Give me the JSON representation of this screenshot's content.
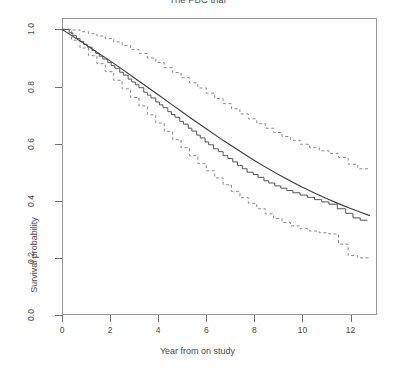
{
  "chart_data": {
    "type": "line",
    "title": "The PBC trial",
    "xlabel": "Year from on study",
    "ylabel": "Survival probability",
    "xlim": [
      0,
      13.1
    ],
    "ylim": [
      0.0,
      1.04
    ],
    "xticks": [
      0,
      2,
      4,
      6,
      8,
      10,
      12
    ],
    "xticklabels": [
      "0",
      "2",
      "4",
      "6",
      "8",
      "10",
      "12"
    ],
    "yticks": [
      0.0,
      0.2,
      0.4,
      0.6,
      0.8,
      1.0
    ],
    "yticklabels": [
      "0.0",
      "0.2",
      "0.4",
      "0.6",
      "0.8",
      "1.0"
    ],
    "grid": false,
    "legend": "none",
    "box": true,
    "colors": {
      "km_step": "#4a4a4a",
      "smooth_fit": "#3a3a3a",
      "confidence_band": "#8a8a8a",
      "axis": "#9a9a9a",
      "text": "#4a4a4a"
    },
    "series": [
      {
        "name": "Kaplan-Meier estimate",
        "style": "step",
        "linestyle": "solid",
        "x": [
          0.0,
          0.3,
          0.45,
          0.6,
          0.75,
          0.9,
          1.05,
          1.25,
          1.4,
          1.55,
          1.7,
          1.9,
          2.05,
          2.2,
          2.4,
          2.55,
          2.75,
          2.9,
          3.05,
          3.2,
          3.4,
          3.55,
          3.7,
          3.9,
          4.05,
          4.2,
          4.4,
          4.55,
          4.7,
          4.9,
          5.05,
          5.25,
          5.4,
          5.6,
          5.75,
          5.95,
          6.1,
          6.3,
          6.5,
          6.7,
          6.9,
          7.1,
          7.3,
          7.5,
          7.7,
          7.95,
          8.15,
          8.4,
          8.6,
          8.85,
          9.1,
          9.35,
          9.6,
          9.9,
          10.2,
          10.5,
          10.8,
          11.1,
          11.45,
          11.8,
          12.1,
          12.4,
          12.7
        ],
        "y": [
          1.0,
          0.988,
          0.978,
          0.968,
          0.958,
          0.948,
          0.938,
          0.926,
          0.916,
          0.906,
          0.896,
          0.884,
          0.874,
          0.864,
          0.85,
          0.84,
          0.826,
          0.816,
          0.806,
          0.796,
          0.78,
          0.77,
          0.76,
          0.746,
          0.736,
          0.726,
          0.712,
          0.702,
          0.692,
          0.678,
          0.668,
          0.654,
          0.644,
          0.63,
          0.62,
          0.606,
          0.596,
          0.582,
          0.572,
          0.558,
          0.548,
          0.536,
          0.524,
          0.512,
          0.5,
          0.492,
          0.482,
          0.47,
          0.462,
          0.452,
          0.444,
          0.436,
          0.428,
          0.42,
          0.412,
          0.404,
          0.396,
          0.388,
          0.372,
          0.356,
          0.34,
          0.332,
          0.332
        ]
      },
      {
        "name": "Fitted / model survival",
        "style": "smooth",
        "linestyle": "solid",
        "x": [
          0.0,
          0.5,
          1.0,
          1.5,
          2.0,
          2.5,
          3.0,
          3.5,
          4.0,
          4.5,
          5.0,
          5.5,
          6.0,
          6.5,
          7.0,
          7.5,
          8.0,
          8.5,
          9.0,
          9.5,
          10.0,
          10.5,
          11.0,
          11.5,
          12.0,
          12.5,
          12.8
        ],
        "y": [
          1.0,
          0.973,
          0.946,
          0.918,
          0.89,
          0.861,
          0.831,
          0.801,
          0.771,
          0.741,
          0.711,
          0.681,
          0.652,
          0.623,
          0.595,
          0.568,
          0.541,
          0.516,
          0.492,
          0.469,
          0.447,
          0.427,
          0.408,
          0.39,
          0.373,
          0.357,
          0.348
        ]
      },
      {
        "name": "Upper 95% confidence limit",
        "style": "step",
        "linestyle": "dashed",
        "x": [
          0.0,
          0.4,
          0.75,
          1.1,
          1.45,
          1.8,
          2.15,
          2.5,
          2.85,
          3.2,
          3.55,
          3.9,
          4.25,
          4.6,
          4.95,
          5.3,
          5.65,
          6.0,
          6.35,
          6.7,
          7.05,
          7.4,
          7.75,
          8.1,
          8.45,
          8.8,
          9.15,
          9.5,
          9.9,
          10.3,
          10.7,
          11.1,
          11.5,
          11.9,
          12.3,
          12.75
        ],
        "y": [
          1.0,
          0.998,
          0.992,
          0.985,
          0.977,
          0.968,
          0.956,
          0.944,
          0.93,
          0.916,
          0.9,
          0.884,
          0.866,
          0.849,
          0.831,
          0.813,
          0.795,
          0.777,
          0.758,
          0.74,
          0.722,
          0.704,
          0.687,
          0.67,
          0.654,
          0.639,
          0.625,
          0.612,
          0.598,
          0.586,
          0.575,
          0.566,
          0.552,
          0.528,
          0.512,
          0.512
        ]
      },
      {
        "name": "Lower 95% confidence limit",
        "style": "step",
        "linestyle": "dashed",
        "x": [
          0.0,
          0.4,
          0.75,
          1.1,
          1.45,
          1.8,
          2.15,
          2.5,
          2.85,
          3.2,
          3.55,
          3.9,
          4.25,
          4.6,
          4.95,
          5.3,
          5.65,
          6.0,
          6.35,
          6.7,
          7.05,
          7.4,
          7.75,
          8.1,
          8.45,
          8.8,
          9.15,
          9.5,
          9.9,
          10.3,
          10.7,
          11.1,
          11.5,
          11.9,
          12.3,
          12.75
        ],
        "y": [
          1.0,
          0.962,
          0.935,
          0.908,
          0.88,
          0.852,
          0.822,
          0.792,
          0.762,
          0.732,
          0.701,
          0.672,
          0.643,
          0.614,
          0.586,
          0.558,
          0.531,
          0.505,
          0.48,
          0.456,
          0.433,
          0.411,
          0.391,
          0.372,
          0.354,
          0.338,
          0.324,
          0.312,
          0.302,
          0.294,
          0.288,
          0.284,
          0.248,
          0.208,
          0.2,
          0.2
        ]
      }
    ]
  }
}
